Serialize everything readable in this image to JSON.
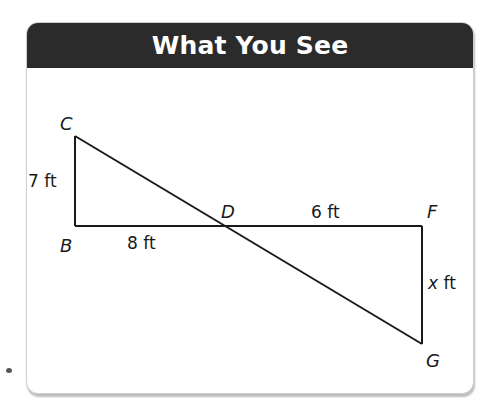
{
  "page_heading_partial": "... ... ... ...",
  "card": {
    "title": "What You See"
  },
  "diagram": {
    "points": {
      "C": {
        "label": "C",
        "x": 75,
        "y": 136
      },
      "B": {
        "label": "B",
        "x": 75,
        "y": 226
      },
      "D": {
        "label": "D",
        "x": 228,
        "y": 226
      },
      "F": {
        "label": "F",
        "x": 422,
        "y": 226
      },
      "G": {
        "label": "G",
        "x": 422,
        "y": 344
      }
    },
    "measurements": {
      "CB": "7 ft",
      "BD": "8 ft",
      "DF": "6 ft",
      "FG_var": "x",
      "FG_unit": " ft"
    },
    "colors": {
      "header_bg": "#2b2b2b",
      "header_text": "#ffffff",
      "line": "#1a1a1a"
    }
  }
}
